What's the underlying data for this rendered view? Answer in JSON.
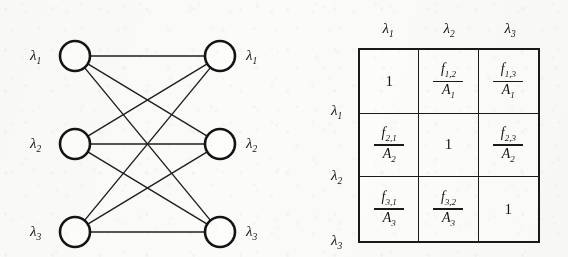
{
  "figure": {
    "background_color": "#fbfbfa",
    "ink_color": "#1a1a1a"
  },
  "graph": {
    "type": "complete-bipartite-graph",
    "name": "K3,3",
    "left_nodes": [
      {
        "id": "L1",
        "label": "λ",
        "sub": "1",
        "cx": 75,
        "cy": 56
      },
      {
        "id": "L2",
        "label": "λ",
        "sub": "2",
        "cx": 75,
        "cy": 144
      },
      {
        "id": "L3",
        "label": "λ",
        "sub": "3",
        "cx": 75,
        "cy": 232
      }
    ],
    "right_nodes": [
      {
        "id": "R1",
        "label": "λ",
        "sub": "1",
        "cx": 220,
        "cy": 56
      },
      {
        "id": "R2",
        "label": "λ",
        "sub": "2",
        "cx": 220,
        "cy": 144
      },
      {
        "id": "R3",
        "label": "λ",
        "sub": "3",
        "cx": 220,
        "cy": 232
      }
    ],
    "node_radius": 15,
    "node_stroke_width": 2.6,
    "edge_stroke_width": 1.4,
    "edges": [
      {
        "from": "L1",
        "to": "R1"
      },
      {
        "from": "L1",
        "to": "R2"
      },
      {
        "from": "L1",
        "to": "R3"
      },
      {
        "from": "L2",
        "to": "R1"
      },
      {
        "from": "L2",
        "to": "R2"
      },
      {
        "from": "L2",
        "to": "R3"
      },
      {
        "from": "L3",
        "to": "R1"
      },
      {
        "from": "L3",
        "to": "R2"
      },
      {
        "from": "L3",
        "to": "R3"
      }
    ],
    "left_labels": [
      "λ1",
      "λ2",
      "λ3"
    ],
    "right_labels": [
      "λ1",
      "λ2",
      "λ3"
    ]
  },
  "matrix": {
    "col_headers": [
      {
        "base": "λ",
        "sub": "1"
      },
      {
        "base": "λ",
        "sub": "2"
      },
      {
        "base": "λ",
        "sub": "3"
      }
    ],
    "row_headers": [
      {
        "base": "λ",
        "sub": "1"
      },
      {
        "base": "λ",
        "sub": "2"
      },
      {
        "base": "λ",
        "sub": "3"
      }
    ],
    "cells": [
      [
        {
          "kind": "scalar",
          "value": "1"
        },
        {
          "kind": "fraction",
          "num_base": "f",
          "num_sub": "1,2",
          "den_base": "A",
          "den_sub": "1"
        },
        {
          "kind": "fraction",
          "num_base": "f",
          "num_sub": "1,3",
          "den_base": "A",
          "den_sub": "1"
        }
      ],
      [
        {
          "kind": "fraction",
          "num_base": "f",
          "num_sub": "2,1",
          "den_base": "A",
          "den_sub": "2"
        },
        {
          "kind": "scalar",
          "value": "1"
        },
        {
          "kind": "fraction",
          "num_base": "f",
          "num_sub": "2,3",
          "den_base": "A",
          "den_sub": "2"
        }
      ],
      [
        {
          "kind": "fraction",
          "num_base": "f",
          "num_sub": "3,1",
          "den_base": "A",
          "den_sub": "3"
        },
        {
          "kind": "fraction",
          "num_base": "f",
          "num_sub": "3,2",
          "den_base": "A",
          "den_sub": "3"
        },
        {
          "kind": "scalar",
          "value": "1"
        }
      ]
    ],
    "cells_text": [
      [
        "1",
        "f1,2 / A1",
        "f1,3 / A1"
      ],
      [
        "f2,1 / A2",
        "1",
        "f2,3 / A2"
      ],
      [
        "f3,1 / A3",
        "f3,2 / A3",
        "1"
      ]
    ]
  }
}
